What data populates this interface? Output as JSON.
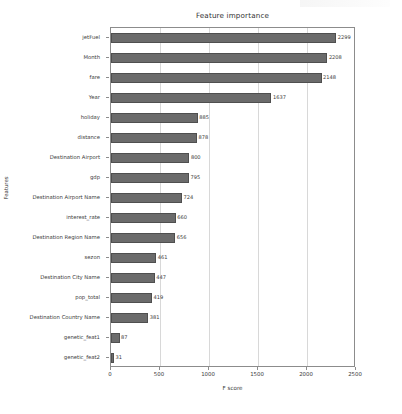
{
  "chart_data": {
    "type": "bar",
    "orientation": "horizontal",
    "title": "Feature importance",
    "xlabel": "F score",
    "ylabel": "Features",
    "xlim": [
      0,
      2500
    ],
    "xticks": [
      0,
      500,
      1000,
      1500,
      2000,
      2500
    ],
    "xtick_labels": [
      "0",
      "500",
      "1000",
      "1500",
      "2000",
      "2500"
    ],
    "grid": "vertical",
    "legend": "none",
    "bar_color": "#6b6b6b",
    "categories": [
      "jetFuel",
      "Month",
      "fare",
      "Year",
      "holiday",
      "distance",
      "Destination Airport",
      "gdp",
      "Destination Airport Name",
      "interest_rate",
      "Destination Region Name",
      "sezon",
      "Destination City Name",
      "pop_total",
      "Destination Country Name",
      "genetic_feat1",
      "genetic_feat2"
    ],
    "values": [
      2299,
      2208,
      2148,
      1637,
      885,
      878,
      800,
      795,
      724,
      660,
      656,
      461,
      447,
      419,
      381,
      87,
      31
    ],
    "value_labels": [
      "2299",
      "2208",
      "2148",
      "1637",
      "885",
      "878",
      "800",
      "795",
      "724",
      "660",
      "656",
      "461",
      "447",
      "419",
      "381",
      "87",
      "31"
    ]
  }
}
